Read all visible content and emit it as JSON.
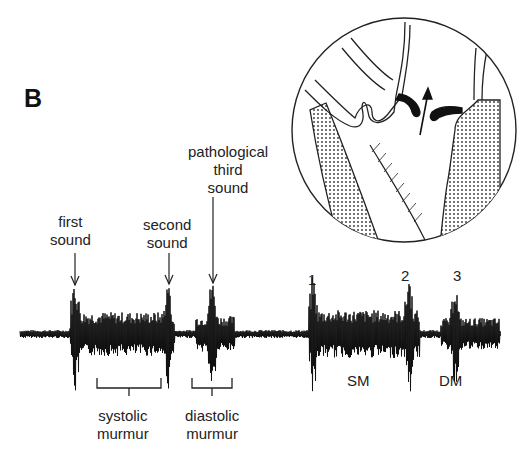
{
  "figure": {
    "panel_label": "B",
    "labels": {
      "first_sound": [
        "first",
        "sound"
      ],
      "second_sound": [
        "second",
        "sound"
      ],
      "third_sound": [
        "pathological",
        "third",
        "sound"
      ],
      "systolic_murmur": [
        "systolic",
        "murmur"
      ],
      "diastolic_murmur": [
        "diastolic",
        "murmur"
      ]
    },
    "markers": {
      "beat2_first": "1",
      "beat2_second": "2",
      "beat2_third": "3",
      "sm": "SM",
      "dm": "DM"
    },
    "inset": {
      "description": "heart cross-section with valve and flow arrow",
      "icon": "heart-valve-inset"
    }
  },
  "colors": {
    "ink": "#111111",
    "text": "#222222",
    "background": "#ffffff"
  }
}
